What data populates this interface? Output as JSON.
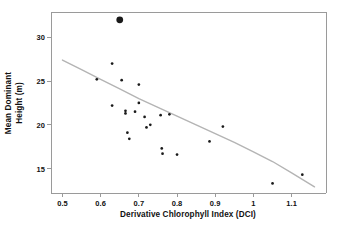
{
  "chart_data": {
    "type": "scatter",
    "title": "",
    "xlabel": "Derivative Chlorophyll Index (DCI)",
    "ylabel_line1": "Mean Dominant",
    "ylabel_line2": "Height (m)",
    "ylabel": "Mean Dominant Height (m)",
    "xlim": [
      0.47,
      1.19
    ],
    "ylim": [
      12.2,
      32.9
    ],
    "xticks": [
      0.5,
      0.6,
      0.7,
      0.8,
      0.9,
      1.0,
      1.1
    ],
    "xtick_labels": [
      "0.5",
      "0.6",
      "0.7",
      "0.8",
      "0.9",
      "1",
      "1.1"
    ],
    "yticks": [
      15,
      20,
      25,
      30
    ],
    "ytick_labels": [
      "15",
      "20",
      "25",
      "30"
    ],
    "grid": false,
    "legend": "none",
    "marker_color": "#1a1a1a",
    "trend_color": "#b4b4b4",
    "axis_color": "#9a9a9a",
    "points": [
      {
        "x": 0.59,
        "y": 25.2,
        "highlight": false
      },
      {
        "x": 0.63,
        "y": 27.0,
        "highlight": false
      },
      {
        "x": 0.63,
        "y": 22.2,
        "highlight": false
      },
      {
        "x": 0.65,
        "y": 32.0,
        "highlight": true
      },
      {
        "x": 0.655,
        "y": 25.1,
        "highlight": false
      },
      {
        "x": 0.665,
        "y": 21.6,
        "highlight": false
      },
      {
        "x": 0.665,
        "y": 21.3,
        "highlight": false
      },
      {
        "x": 0.67,
        "y": 19.1,
        "highlight": false
      },
      {
        "x": 0.675,
        "y": 18.4,
        "highlight": false
      },
      {
        "x": 0.69,
        "y": 21.5,
        "highlight": false
      },
      {
        "x": 0.7,
        "y": 24.6,
        "highlight": false
      },
      {
        "x": 0.7,
        "y": 22.5,
        "highlight": false
      },
      {
        "x": 0.715,
        "y": 20.9,
        "highlight": false
      },
      {
        "x": 0.72,
        "y": 19.7,
        "highlight": false
      },
      {
        "x": 0.73,
        "y": 20.0,
        "highlight": false
      },
      {
        "x": 0.757,
        "y": 21.1,
        "highlight": false
      },
      {
        "x": 0.76,
        "y": 17.3,
        "highlight": false
      },
      {
        "x": 0.762,
        "y": 16.7,
        "highlight": false
      },
      {
        "x": 0.78,
        "y": 21.2,
        "highlight": false
      },
      {
        "x": 0.8,
        "y": 16.6,
        "highlight": false
      },
      {
        "x": 0.885,
        "y": 18.1,
        "highlight": false
      },
      {
        "x": 0.92,
        "y": 19.8,
        "highlight": false
      },
      {
        "x": 1.05,
        "y": 13.3,
        "highlight": false
      },
      {
        "x": 1.128,
        "y": 14.3,
        "highlight": false
      }
    ],
    "trend_line": {
      "label": "fitted decreasing curve",
      "x": [
        0.5,
        0.55,
        0.6,
        0.65,
        0.7,
        0.75,
        0.8,
        0.85,
        0.9,
        0.95,
        1.0,
        1.05,
        1.1,
        1.16
      ],
      "y": [
        27.4,
        26.3,
        25.2,
        24.1,
        23.0,
        22.0,
        21.0,
        20.0,
        19.0,
        18.0,
        16.9,
        15.8,
        14.5,
        12.9
      ]
    }
  }
}
